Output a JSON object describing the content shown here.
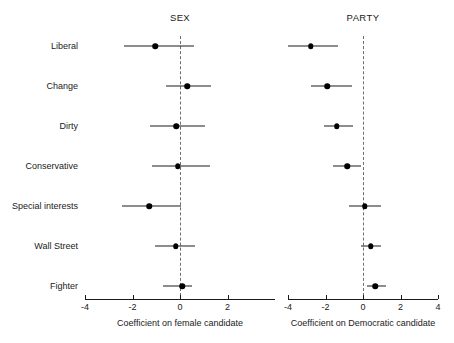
{
  "chart_data": {
    "type": "scatter",
    "title": "",
    "plot_style": "coefficient-forest-plot",
    "grid": false,
    "legend": null,
    "categories": [
      "Liberal",
      "Change",
      "Dirty",
      "Conservative",
      "Special interests",
      "Wall Street",
      "Fighter"
    ],
    "panels": [
      {
        "title": "SEX",
        "xlabel": "Coefficient on female candidate",
        "xlim": [
          -4.4,
          4.0
        ],
        "ticks": [
          -4,
          -2,
          0,
          2
        ],
        "tick_labels": [
          "-4",
          "-2",
          "0",
          "2"
        ],
        "reference_line": 0,
        "estimates": [
          -1.05,
          0.3,
          -0.15,
          -0.1,
          -1.3,
          -0.17,
          0.1
        ],
        "ci_low": [
          -2.35,
          -0.6,
          -1.25,
          -1.2,
          -2.45,
          -1.05,
          -0.7
        ],
        "ci_high": [
          0.6,
          1.3,
          1.05,
          1.25,
          0.05,
          0.65,
          0.5
        ]
      },
      {
        "title": "PARTY",
        "xlabel": "Coefficient on Democratic candidate",
        "xlim": [
          -4.2,
          4.2
        ],
        "ticks": [
          -4,
          -2,
          0,
          2,
          4
        ],
        "tick_labels": [
          "-4",
          "-2",
          "0",
          "2",
          "4"
        ],
        "reference_line": 0,
        "estimates": [
          -2.8,
          -1.9,
          -1.4,
          -0.85,
          0.1,
          0.4,
          0.65
        ],
        "ci_low": [
          -4.0,
          -2.8,
          -2.1,
          -1.6,
          -0.75,
          -0.1,
          0.2
        ],
        "ci_high": [
          -1.35,
          -0.6,
          -0.55,
          -0.1,
          0.95,
          0.95,
          1.2
        ]
      }
    ],
    "colors": {
      "point": "#000000",
      "interval": "#1a1a1a",
      "reference": "#555555",
      "background": "#ffffff"
    }
  }
}
